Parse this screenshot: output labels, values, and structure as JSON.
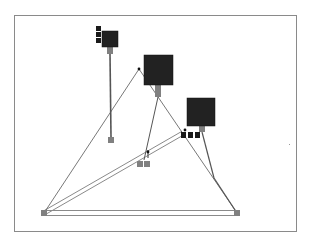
{
  "diagram": {
    "frame": {
      "x": 14,
      "y": 15,
      "width": 283,
      "height": 217,
      "border_color": "#8a8a8a"
    },
    "colors": {
      "node_fill": "#222222",
      "pad_fill": "#808080",
      "port_fill": "#1a1a1a",
      "edge": "#555555",
      "double_edge": "#8a8a8a",
      "background": "#ffffff"
    },
    "nodes": [
      {
        "id": "node-a",
        "x": 102,
        "y": 31,
        "w": 16,
        "h": 16,
        "pad": {
          "x": 107,
          "y": 47,
          "w": 6,
          "h": 7
        },
        "ports": [
          {
            "x": 96,
            "y": 26
          },
          {
            "x": 96,
            "y": 32
          },
          {
            "x": 96,
            "y": 38
          }
        ]
      },
      {
        "id": "node-b",
        "x": 144,
        "y": 55,
        "w": 29,
        "h": 30,
        "pad": {
          "x": 155,
          "y": 85,
          "w": 6,
          "h": 12
        },
        "ports": []
      },
      {
        "id": "node-c",
        "x": 187,
        "y": 98,
        "w": 28,
        "h": 28,
        "pad": {
          "x": 199,
          "y": 126,
          "w": 6,
          "h": 6
        },
        "ports": []
      }
    ],
    "terminals": [
      {
        "id": "term-a-end",
        "x": 108,
        "y": 137,
        "w": 6,
        "h": 6,
        "color": "#808080"
      },
      {
        "id": "term-mid",
        "x": 137,
        "y": 161,
        "w": 14,
        "h": 6,
        "color": "#808080"
      },
      {
        "id": "term-left",
        "x": 41,
        "y": 210,
        "w": 6,
        "h": 6,
        "color": "#808080"
      },
      {
        "id": "term-right",
        "x": 234,
        "y": 210,
        "w": 6,
        "h": 6,
        "color": "#808080"
      },
      {
        "id": "term-junction",
        "x": 181,
        "y": 132,
        "w": 20,
        "h": 6,
        "color": "#1a1a1a"
      }
    ],
    "junction_dots": [
      {
        "x": 139,
        "y": 69
      },
      {
        "x": 185,
        "y": 130
      },
      {
        "x": 148,
        "y": 152
      }
    ],
    "edges": [
      {
        "from": [
          110,
          54
        ],
        "to": [
          111,
          137
        ],
        "width": 1.6
      },
      {
        "from": [
          139,
          69
        ],
        "to": [
          44,
          213
        ],
        "width": 0.8
      },
      {
        "from": [
          139,
          69
        ],
        "to": [
          237,
          213
        ],
        "width": 0.8
      },
      {
        "from": [
          158,
          97
        ],
        "to": [
          144,
          160
        ],
        "width": 1
      },
      {
        "from": [
          202,
          132
        ],
        "to": [
          214,
          178
        ],
        "width": 1.2
      },
      {
        "from": [
          214,
          178
        ],
        "to": [
          237,
          213
        ],
        "width": 1.2
      },
      {
        "from": [
          148,
          150
        ],
        "to": [
          148,
          158
        ],
        "width": 1.2
      }
    ],
    "double_edges": [
      {
        "from": [
          44,
          213
        ],
        "to": [
          237,
          213
        ],
        "gap": 5
      },
      {
        "from": [
          44,
          213
        ],
        "to": [
          183,
          133
        ],
        "gap": 4
      }
    ],
    "misc_marks": [
      {
        "x": 289,
        "y": 144,
        "w": 1,
        "h": 1
      }
    ]
  }
}
